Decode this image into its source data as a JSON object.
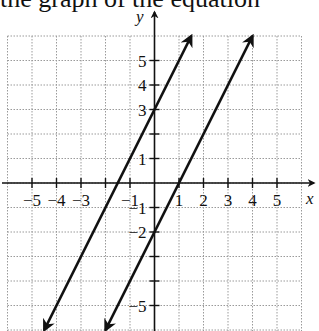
{
  "caption_fragment": "the graph of the equation",
  "chart_data": {
    "type": "line",
    "title": "",
    "xlabel": "x",
    "ylabel": "y",
    "xlim": [
      -6,
      6
    ],
    "ylim": [
      -6,
      6
    ],
    "grid": true,
    "grid_style": "dotted",
    "x_ticks": [
      -5,
      -4,
      -3,
      -2,
      -1,
      1,
      2,
      3,
      4,
      5
    ],
    "x_tick_labels": [
      "−5",
      "−4",
      "−3",
      "",
      "−1",
      "1",
      "2",
      "3",
      "4",
      "5"
    ],
    "y_ticks": [
      -5,
      -4,
      -3,
      -2,
      -1,
      1,
      2,
      3,
      4,
      5
    ],
    "y_tick_labels": [
      "−5",
      "",
      "",
      "−2",
      "−1",
      "1",
      "",
      "3",
      "4",
      "5"
    ],
    "series": [
      {
        "name": "y = 2x + 3",
        "slope": 2,
        "intercept": 3,
        "x": [
          -4.5,
          1.5
        ],
        "y": [
          -6,
          6
        ],
        "arrows": "both"
      },
      {
        "name": "y = 2x − 2",
        "slope": 2,
        "intercept": -2,
        "x": [
          -2,
          4
        ],
        "y": [
          -6,
          6
        ],
        "arrows": "both"
      }
    ]
  },
  "colors": {
    "line": "#111111",
    "grid": "#9a9a9a",
    "axis": "#111111"
  }
}
